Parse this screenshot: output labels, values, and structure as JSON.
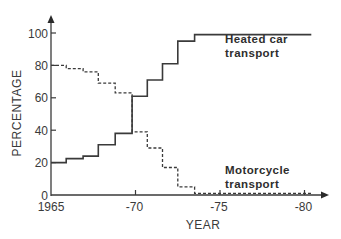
{
  "chart_data": {
    "type": "line",
    "step": true,
    "title": "",
    "xlabel": "YEAR",
    "ylabel": "PERCENTAGE",
    "xlim": [
      1965,
      1981
    ],
    "ylim": [
      0,
      100
    ],
    "x_ticks": [
      {
        "value": 1965,
        "label": "1965"
      },
      {
        "value": 1970,
        "label": "-70"
      },
      {
        "value": 1975,
        "label": "-75"
      },
      {
        "value": 1980,
        "label": "-80"
      }
    ],
    "y_ticks": [
      {
        "value": 0,
        "label": "0"
      },
      {
        "value": 20,
        "label": "20"
      },
      {
        "value": 40,
        "label": "40"
      },
      {
        "value": 60,
        "label": "60"
      },
      {
        "value": 80,
        "label": "80"
      },
      {
        "value": 100,
        "label": "100"
      }
    ],
    "grid": false,
    "series": [
      {
        "name": "Heated car transport",
        "style": "solid",
        "color": "#3a3a3a",
        "x": [
          1965,
          1965.9,
          1966.9,
          1967.8,
          1968.8,
          1969.8,
          1970.7,
          1971.6,
          1972.5,
          1973.5,
          1980.4
        ],
        "y": [
          20,
          22.5,
          24,
          31,
          38,
          61,
          71,
          81,
          95,
          99,
          100
        ]
      },
      {
        "name": "Motorcycle transport",
        "style": "dashed",
        "color": "#3a3a3a",
        "x": [
          1965,
          1965.9,
          1966.9,
          1967.8,
          1968.8,
          1969.8,
          1970.7,
          1971.6,
          1972.5,
          1973.5,
          1980.4
        ],
        "y": [
          80,
          78,
          76,
          69,
          63,
          39,
          29,
          17,
          5,
          1,
          1
        ]
      }
    ],
    "annotations": [
      {
        "series": 0,
        "lines": [
          "Heated car",
          "transport"
        ],
        "anchor_x": 1975.3,
        "anchor_y": 94
      },
      {
        "series": 1,
        "lines": [
          "Motorcycle",
          "transport"
        ],
        "anchor_x": 1975.3,
        "anchor_y": 13
      }
    ],
    "legend": "none (inline annotations)"
  }
}
